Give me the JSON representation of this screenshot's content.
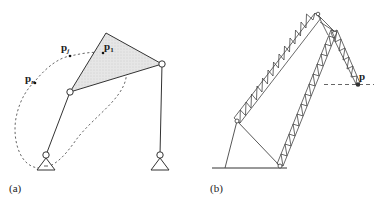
{
  "figure": {
    "panels": [
      {
        "id": "a",
        "caption": "(a)",
        "description": "Four-bar linkage with coupler triangle tracing a closed path",
        "points": [
          {
            "label": "p",
            "subscript": "j"
          },
          {
            "label": "p",
            "subscript": "1"
          },
          {
            "label": "p",
            "subscript": "n"
          }
        ]
      },
      {
        "id": "b",
        "caption": "(b)",
        "description": "Lattice crane boom linkage with end-effector point",
        "points": [
          {
            "label": "p",
            "subscript": ""
          }
        ]
      }
    ],
    "colors": {
      "line": "#333333",
      "coupler_fill": "#e2e2e2",
      "path_dash": "#555555"
    }
  }
}
